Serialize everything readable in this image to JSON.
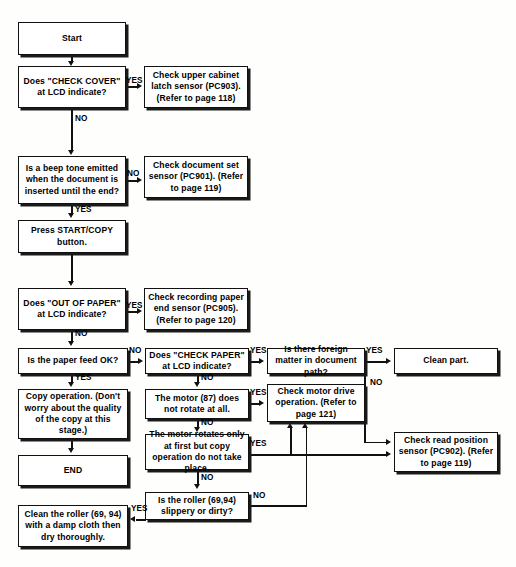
{
  "diagram": {
    "nodes": {
      "start": "Start",
      "check_cover": "Does \"CHECK COVER\" at LCD indicate?",
      "upper_cabinet": "Check upper cabinet latch sensor (PC903). (Refer to page 118)",
      "beep_tone": "Is a beep tone emitted when the document is inserted until the end?",
      "document_set": "Check document set sensor (PC901). (Refer to page 119)",
      "press_start": "Press START/COPY button.",
      "out_of_paper": "Does \"OUT OF PAPER\" at LCD indicate?",
      "recording_paper": "Check recording paper end sensor (PC905). (Refer to page 120)",
      "paper_feed": "Is the paper feed OK?",
      "check_paper": "Does \"CHECK PAPER\" at LCD indicate?",
      "foreign_matter": "Is there foreign matter in document path?",
      "clean_part": "Clean part.",
      "copy_operation": "Copy operation. (Don't worry about the quality of the copy at this stage.)",
      "motor_no_rotate": "The motor (87) does not rotate at all.",
      "motor_drive": "Check motor drive operation. (Refer to page 121)",
      "motor_first_only": "The motor rotates only at first but copy operation do not take place.",
      "read_position": "Check read position sensor (PC902). (Refer to page 119)",
      "end": "END",
      "roller_slippery": "Is the roller (69,94) slippery or dirty?",
      "clean_roller": "Clean the roller (69, 94) with a damp cloth then dry thoroughly."
    },
    "labels": {
      "yes": "YES",
      "no": "NO"
    },
    "edges": [
      {
        "from": "start",
        "to": "check_cover",
        "label": ""
      },
      {
        "from": "check_cover",
        "to": "upper_cabinet",
        "label": "YES"
      },
      {
        "from": "check_cover",
        "to": "beep_tone",
        "label": "NO"
      },
      {
        "from": "beep_tone",
        "to": "document_set",
        "label": "NO"
      },
      {
        "from": "beep_tone",
        "to": "press_start",
        "label": "YES"
      },
      {
        "from": "press_start",
        "to": "out_of_paper",
        "label": ""
      },
      {
        "from": "out_of_paper",
        "to": "recording_paper",
        "label": "YES"
      },
      {
        "from": "out_of_paper",
        "to": "paper_feed",
        "label": "NO"
      },
      {
        "from": "paper_feed",
        "to": "check_paper",
        "label": "NO"
      },
      {
        "from": "paper_feed",
        "to": "copy_operation",
        "label": "YES"
      },
      {
        "from": "check_paper",
        "to": "foreign_matter",
        "label": "YES"
      },
      {
        "from": "check_paper",
        "to": "motor_no_rotate",
        "label": "NO"
      },
      {
        "from": "foreign_matter",
        "to": "clean_part",
        "label": "YES"
      },
      {
        "from": "foreign_matter",
        "to": "read_position",
        "label": "NO"
      },
      {
        "from": "motor_no_rotate",
        "to": "motor_drive",
        "label": "YES"
      },
      {
        "from": "motor_no_rotate",
        "to": "motor_first_only",
        "label": "NO"
      },
      {
        "from": "motor_first_only",
        "to": "read_position",
        "label": "YES"
      },
      {
        "from": "motor_first_only",
        "to": "roller_slippery",
        "label": "NO"
      },
      {
        "from": "roller_slippery",
        "to": "clean_roller",
        "label": "YES"
      },
      {
        "from": "roller_slippery",
        "to": "motor_drive",
        "label": "NO"
      },
      {
        "from": "copy_operation",
        "to": "end",
        "label": ""
      }
    ],
    "colors": {
      "line": "#111111",
      "box_border": "#111111",
      "box_fill": "#ffffff",
      "page_background": "#fefefd"
    }
  }
}
